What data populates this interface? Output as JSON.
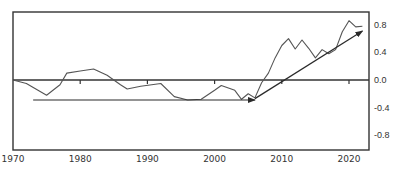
{
  "chart_data": {
    "type": "line",
    "title": "",
    "xlabel": "",
    "ylabel": "",
    "xlim": [
      1970,
      2023
    ],
    "ylim": [
      -1.05,
      0.98
    ],
    "grid": false,
    "legend": null,
    "x_ticks": [
      1970,
      1980,
      1990,
      2000,
      2010,
      2020
    ],
    "x_tick_labels": [
      "1970",
      "1980",
      "1990",
      "2000",
      "2010",
      "2020"
    ],
    "y_ticks": [
      0.8,
      0.4,
      0.0,
      -0.4,
      -0.8
    ],
    "y_tick_labels": [
      "0.8",
      "0.4",
      "0.0",
      "-0.4",
      "-0.8"
    ],
    "y_axis_position": "right",
    "zero_line": true,
    "series": [
      {
        "name": "series",
        "x": [
          1970,
          1972,
          1975,
          1977,
          1978,
          1980,
          1982,
          1984,
          1986,
          1987,
          1989,
          1992,
          1994,
          1996,
          1998,
          2000,
          2001,
          2003,
          2004,
          2005,
          2006,
          2007,
          2008,
          2009,
          2010,
          2011,
          2012,
          2013,
          2014,
          2015,
          2016,
          2017,
          2018,
          2019,
          2020,
          2021,
          2022
        ],
        "values": [
          0.0,
          -0.05,
          -0.22,
          -0.07,
          0.1,
          0.13,
          0.16,
          0.07,
          -0.07,
          -0.13,
          -0.09,
          -0.05,
          -0.24,
          -0.29,
          -0.28,
          -0.15,
          -0.08,
          -0.15,
          -0.28,
          -0.2,
          -0.26,
          -0.04,
          0.1,
          0.32,
          0.5,
          0.6,
          0.45,
          0.58,
          0.46,
          0.32,
          0.44,
          0.38,
          0.44,
          0.7,
          0.86,
          0.77,
          0.78
        ]
      }
    ],
    "annotations": [
      {
        "type": "arrow",
        "label": "flat trend",
        "from": [
          1973,
          -0.29
        ],
        "to": [
          2006,
          -0.29
        ]
      },
      {
        "type": "arrow",
        "label": "rising trend",
        "from": [
          2006,
          -0.27
        ],
        "to": [
          2022,
          0.71
        ]
      }
    ]
  }
}
